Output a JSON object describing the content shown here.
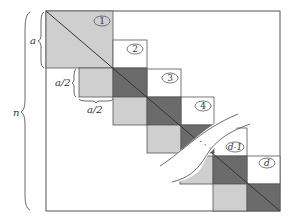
{
  "diagram": {
    "type": "block-diagonal matrix schematic",
    "colors": {
      "light_block": "#cfcfcf",
      "dark_block": "#6b6b6b",
      "outline": "#555555",
      "background": "#ffffff"
    },
    "dimension_labels": {
      "n": "n",
      "a": "a",
      "a_half_vertical": "a/2",
      "a_half_horizontal": "a/2"
    },
    "block_labels": [
      "1",
      "2",
      "3",
      "4",
      "d-1",
      "d"
    ],
    "ellipsis": "· · ·"
  }
}
